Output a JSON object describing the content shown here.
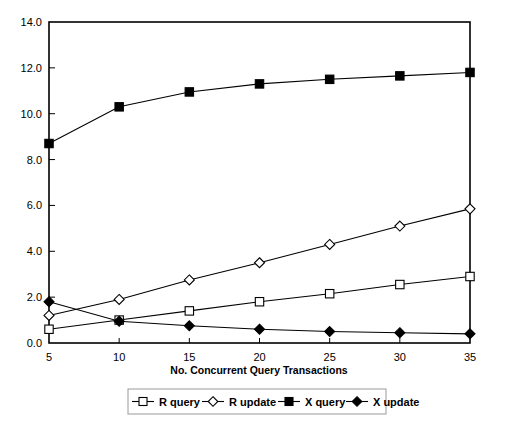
{
  "chart_data": {
    "type": "line",
    "title": "",
    "xlabel": "No. Concurrent Query Transactions",
    "ylabel": "",
    "x": [
      5,
      10,
      15,
      20,
      25,
      30,
      35
    ],
    "xtick_labels": [
      "5",
      "10",
      "15",
      "20",
      "25",
      "30",
      "35"
    ],
    "ytick_labels": [
      "0.0",
      "2.0",
      "4.0",
      "6.0",
      "8.0",
      "10.0",
      "12.0",
      "14.0"
    ],
    "yticks": [
      0.0,
      2.0,
      4.0,
      6.0,
      8.0,
      10.0,
      12.0,
      14.0
    ],
    "xlim": [
      5,
      35
    ],
    "ylim": [
      0.0,
      14.0
    ],
    "grid": false,
    "legend_position": "bottom",
    "series": [
      {
        "name": "R query",
        "marker": "open-square",
        "values": [
          0.6,
          1.0,
          1.4,
          1.8,
          2.15,
          2.55,
          2.9
        ]
      },
      {
        "name": "R update",
        "marker": "open-diamond",
        "values": [
          1.2,
          1.9,
          2.75,
          3.5,
          4.3,
          5.1,
          5.85
        ]
      },
      {
        "name": "X query",
        "marker": "filled-square",
        "values": [
          8.7,
          10.3,
          10.95,
          11.3,
          11.5,
          11.65,
          11.8
        ]
      },
      {
        "name": "X update",
        "marker": "filled-diamond",
        "values": [
          1.8,
          0.95,
          0.75,
          0.6,
          0.5,
          0.45,
          0.4
        ]
      }
    ]
  },
  "legend": {
    "entries": [
      {
        "label": "R query",
        "marker": "open-square"
      },
      {
        "label": "R update",
        "marker": "open-diamond"
      },
      {
        "label": "X query",
        "marker": "filled-square"
      },
      {
        "label": "X update",
        "marker": "filled-diamond"
      }
    ]
  }
}
